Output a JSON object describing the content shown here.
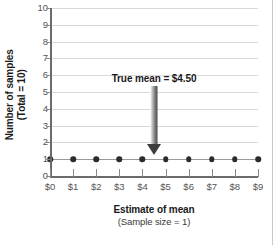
{
  "chart_data": {
    "type": "scatter",
    "title": "",
    "xlabel": "Estimate of mean",
    "xlabel_sub": "(Sample size = 1)",
    "ylabel": "Number of samples",
    "ylabel_sub": "(Total = 10)",
    "x": [
      0,
      1,
      2,
      3,
      4,
      5,
      6,
      7,
      8,
      9
    ],
    "values": [
      1,
      1,
      1,
      1,
      1,
      1,
      1,
      1,
      1,
      1
    ],
    "xtick_labels": [
      "$0",
      "$1",
      "$2",
      "$3",
      "$4",
      "$5",
      "$6",
      "$7",
      "$8",
      "$9"
    ],
    "ytick_labels": [
      "0",
      "1",
      "2",
      "3",
      "4",
      "5",
      "6",
      "7",
      "8",
      "9",
      "10"
    ],
    "ytick_values": [
      0,
      1,
      2,
      3,
      4,
      5,
      6,
      7,
      8,
      9,
      10
    ],
    "xlim": [
      0,
      9
    ],
    "ylim": [
      0,
      10
    ],
    "grid": "horizontal",
    "legend": "none",
    "marker_color": "#2b2b2b",
    "gridline_color": "#d9d9d9",
    "axis_color": "#6b6b6b",
    "annotations": [
      {
        "name": "true-mean",
        "text": "True mean  =  $4.50",
        "x": 4.5,
        "y_text": 5.75,
        "arrow_from_y": 5.35,
        "arrow_to_y": 1.25,
        "arrow_color": "#3d3d3d"
      }
    ]
  }
}
